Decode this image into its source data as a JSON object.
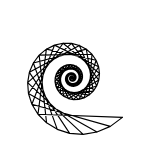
{
  "image": {
    "title": "Spiral String Art Figure",
    "width": 150,
    "height": 159,
    "background_color": "#ffffff",
    "ink_color": "#000000",
    "description": "Black line-art spiral string figure on white background"
  },
  "chart_data": {
    "type": "line",
    "subtitle": "Chords connecting points on an inward logarithmic spiral",
    "xlabel": "",
    "ylabel": "",
    "xlim": [
      0,
      150
    ],
    "ylim": [
      0,
      159
    ],
    "grid": false,
    "legend": null,
    "annotations": [
      {
        "name": "center-dot",
        "x": 72,
        "y": 78,
        "radius": 1.6,
        "color": "#000000"
      }
    ],
    "generator": {
      "kind": "logarithmic-spiral-chords",
      "center_x": 72,
      "center_y": 78,
      "start_radius": 64,
      "decay_per_step": 0.9645,
      "angle_step_deg": 13.6,
      "start_angle_deg": 38,
      "num_points": 108,
      "chord_skip": 7,
      "stroke_width": 1.15,
      "stroke_color": "#000000",
      "eye_radius": 9
    },
    "series": [
      {
        "name": "spiral-chords",
        "values": [
          64,
          61.7,
          59.5,
          57.4,
          55.4,
          53.4,
          51.5,
          49.7,
          47.9,
          46.2,
          44.6,
          43.0,
          41.5,
          40.0,
          38.6,
          37.2,
          35.9,
          34.6,
          33.4,
          32.2,
          31.1,
          30.0,
          28.9,
          27.9,
          26.9,
          25.9,
          25.0,
          24.1,
          23.3,
          22.4,
          21.6,
          20.9,
          20.1,
          19.4,
          18.7,
          18.1,
          17.4,
          16.8,
          16.2,
          15.6,
          15.1,
          14.5,
          14.0,
          13.5,
          13.0,
          12.6,
          12.1,
          11.7,
          11.3,
          10.9,
          10.5,
          10.1,
          9.8,
          9.4,
          9.1,
          8.8,
          8.5,
          8.2,
          7.9,
          7.6,
          7.3,
          7.1,
          6.8,
          6.6,
          6.4,
          6.1,
          5.9,
          5.7,
          5.5,
          5.3,
          5.1,
          4.9,
          4.8,
          4.6,
          4.4,
          4.3,
          4.1,
          4.0,
          3.8,
          3.7,
          3.6,
          3.4,
          3.3,
          3.2,
          3.1,
          3.0,
          2.9,
          2.8,
          2.7,
          2.6,
          2.5,
          2.4,
          2.3,
          2.2,
          2.1,
          2.1,
          2.0,
          1.9,
          1.8,
          1.8,
          1.7,
          1.7,
          1.6,
          1.5,
          1.5,
          1.4,
          1.4,
          1.3
        ]
      }
    ]
  }
}
